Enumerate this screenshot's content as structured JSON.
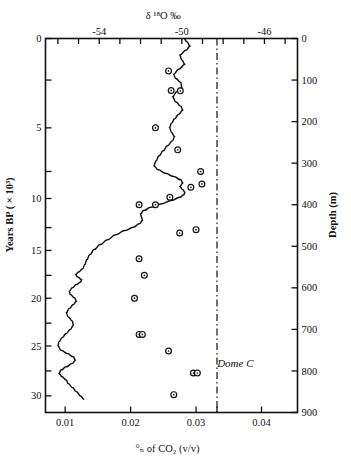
{
  "figure": {
    "name": "dome-c-ice-core-co2-d18o",
    "site_label": "Dome C"
  },
  "chart_data": {
    "type": "line",
    "title": "",
    "xlabel": "% of CO2 (v/v)",
    "xlabel_rich": "°ₙ of CO₂ (v/v)",
    "ylabel": "Years BP ( × 10³)",
    "y2label": "Depth (m)",
    "top_axis_label": "δ ¹⁸O ‰",
    "xlim": [
      0.007,
      0.0455
    ],
    "xticks": [
      0.01,
      0.02,
      0.03,
      0.04
    ],
    "xtick_labels": [
      "0.01",
      "0.02",
      "0.03",
      "0.04"
    ],
    "x_extra_tick": 0.0332,
    "top_axis": {
      "label": "δ ¹⁸O ‰",
      "ticks": [
        -56,
        -55,
        -54,
        -53,
        -52,
        -51,
        -50,
        -49,
        -48,
        -47,
        -46,
        -45
      ],
      "labeled_ticks": [
        -54,
        -50,
        -46
      ],
      "labels": [
        "-54",
        "-50",
        "-46"
      ],
      "lim": [
        -56.6,
        -44.4
      ]
    },
    "y_left": {
      "label": "Years BP ( × 10³)",
      "lim": [
        0,
        32
      ],
      "ticks": [
        0,
        2.5,
        5,
        7.5,
        10,
        12.5,
        15,
        17.5,
        20,
        22.5,
        25,
        27.5,
        30
      ],
      "labeled_ticks": [
        0,
        5,
        10,
        15,
        20,
        25,
        30
      ],
      "labels": [
        "0",
        "5",
        "10",
        "15",
        "20",
        "25",
        "30"
      ],
      "tick_depths_m": [
        0,
        100,
        215,
        320,
        385,
        455,
        510,
        570,
        625,
        685,
        740,
        800,
        860
      ]
    },
    "y_right": {
      "label": "Depth (m)",
      "lim": [
        0,
        900
      ],
      "ticks": [
        0,
        100,
        200,
        300,
        400,
        500,
        600,
        700,
        800,
        900
      ],
      "labels": [
        "0",
        "100",
        "200",
        "300",
        "400",
        "500",
        "600",
        "700",
        "800",
        "900"
      ]
    },
    "grid": false,
    "legend": null,
    "reference_line": {
      "name": "preindustrial-co2-reference",
      "value": 0.0332,
      "style": "dash-dot",
      "orientation": "vertical"
    },
    "series": [
      {
        "name": "d18O profile",
        "axis": "top",
        "style": "solid-line",
        "points_depth_d18O": [
          [
            0,
            -49.9
          ],
          [
            8,
            -49.75
          ],
          [
            18,
            -49.6
          ],
          [
            28,
            -49.8
          ],
          [
            40,
            -50.1
          ],
          [
            52,
            -50.0
          ],
          [
            62,
            -49.85
          ],
          [
            74,
            -50.15
          ],
          [
            86,
            -50.4
          ],
          [
            96,
            -50.3
          ],
          [
            106,
            -50.05
          ],
          [
            118,
            -50.0
          ],
          [
            128,
            -50.25
          ],
          [
            140,
            -50.45
          ],
          [
            152,
            -50.3
          ],
          [
            163,
            -50.05
          ],
          [
            172,
            -49.95
          ],
          [
            182,
            -50.15
          ],
          [
            193,
            -50.35
          ],
          [
            204,
            -50.5
          ],
          [
            214,
            -50.6
          ],
          [
            226,
            -50.5
          ],
          [
            236,
            -50.35
          ],
          [
            246,
            -50.45
          ],
          [
            258,
            -50.7
          ],
          [
            270,
            -50.9
          ],
          [
            282,
            -51.1
          ],
          [
            294,
            -51.25
          ],
          [
            306,
            -51.35
          ],
          [
            316,
            -51.15
          ],
          [
            324,
            -50.8
          ],
          [
            332,
            -50.4
          ],
          [
            340,
            -50.05
          ],
          [
            348,
            -49.95
          ],
          [
            356,
            -50.1
          ],
          [
            364,
            -49.95
          ],
          [
            370,
            -49.85
          ],
          [
            376,
            -49.9
          ],
          [
            382,
            -50.1
          ],
          [
            390,
            -50.5
          ],
          [
            398,
            -51.0
          ],
          [
            406,
            -51.5
          ],
          [
            414,
            -51.85
          ],
          [
            422,
            -52.0
          ],
          [
            430,
            -51.95
          ],
          [
            438,
            -51.9
          ],
          [
            446,
            -52.05
          ],
          [
            454,
            -52.35
          ],
          [
            462,
            -52.75
          ],
          [
            472,
            -53.2
          ],
          [
            484,
            -53.6
          ],
          [
            496,
            -53.95
          ],
          [
            508,
            -54.25
          ],
          [
            520,
            -54.45
          ],
          [
            532,
            -54.6
          ],
          [
            544,
            -54.7
          ],
          [
            554,
            -54.8
          ],
          [
            562,
            -55.0
          ],
          [
            568,
            -55.15
          ],
          [
            574,
            -55.05
          ],
          [
            580,
            -54.85
          ],
          [
            586,
            -54.9
          ],
          [
            592,
            -55.1
          ],
          [
            600,
            -55.3
          ],
          [
            608,
            -55.45
          ],
          [
            616,
            -55.4
          ],
          [
            624,
            -55.2
          ],
          [
            632,
            -55.1
          ],
          [
            640,
            -55.25
          ],
          [
            650,
            -55.45
          ],
          [
            660,
            -55.6
          ],
          [
            670,
            -55.5
          ],
          [
            680,
            -55.3
          ],
          [
            690,
            -55.25
          ],
          [
            700,
            -55.4
          ],
          [
            710,
            -55.6
          ],
          [
            720,
            -55.8
          ],
          [
            730,
            -55.95
          ],
          [
            740,
            -56.0
          ],
          [
            750,
            -55.85
          ],
          [
            758,
            -55.55
          ],
          [
            766,
            -55.25
          ],
          [
            774,
            -55.15
          ],
          [
            782,
            -55.3
          ],
          [
            790,
            -55.6
          ],
          [
            798,
            -55.85
          ],
          [
            806,
            -55.95
          ],
          [
            814,
            -55.8
          ],
          [
            822,
            -55.6
          ],
          [
            830,
            -55.5
          ],
          [
            840,
            -55.3
          ],
          [
            850,
            -55.1
          ],
          [
            860,
            -54.9
          ],
          [
            868,
            -54.75
          ]
        ]
      },
      {
        "name": "CO2 measurements",
        "axis": "bottom",
        "style": "open-circle-markers",
        "points_co2_depth": [
          [
            0.0258,
            78
          ],
          [
            0.0262,
            125
          ],
          [
            0.0276,
            126
          ],
          [
            0.0238,
            215
          ],
          [
            0.0272,
            268
          ],
          [
            0.0292,
            358
          ],
          [
            0.026,
            382
          ],
          [
            0.0213,
            400
          ],
          [
            0.0238,
            400
          ],
          [
            0.0307,
            320
          ],
          [
            0.0309,
            350
          ],
          [
            0.0275,
            468
          ],
          [
            0.03,
            460
          ],
          [
            0.0213,
            530
          ],
          [
            0.0221,
            570
          ],
          [
            0.0206,
            625
          ],
          [
            0.0213,
            712
          ],
          [
            0.0218,
            712
          ],
          [
            0.0258,
            752
          ],
          [
            0.0296,
            805
          ],
          [
            0.0302,
            805
          ],
          [
            0.0266,
            857
          ],
          [
            0.0266,
            913
          ],
          [
            0.0283,
            950
          ]
        ]
      }
    ],
    "annotations": [
      {
        "text": "Dome C",
        "x": 0.036,
        "depth": 790,
        "style": "italic"
      }
    ]
  }
}
